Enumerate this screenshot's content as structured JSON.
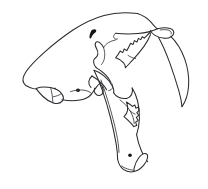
{
  "figure": {
    "style": "black ink line drawing, outline only, no shading",
    "background_color": "#ffffff",
    "line_color": "#2b2b2f",
    "mark_color": "#16161a",
    "width_px": 208,
    "height_px": 189,
    "caption": ""
  },
  "anatomy": {
    "parts": [
      {
        "id": "cranium",
        "label": "Cranium / braincase"
      },
      {
        "id": "frontal-foramen",
        "label": "Supraorbital marking"
      },
      {
        "id": "orbit",
        "label": "Orbit"
      },
      {
        "id": "zygomatic-arch",
        "label": "Zygomatic arch"
      },
      {
        "id": "nasal-snout",
        "label": "Nasal and snout"
      },
      {
        "id": "premaxilla-incisors",
        "label": "Premaxilla with incisors"
      },
      {
        "id": "infraorbital-dot",
        "label": "Infraorbital foramen"
      },
      {
        "id": "saber-canine",
        "label": "Upper saber canine"
      },
      {
        "id": "canine-root",
        "label": "Canine root and alveolus"
      },
      {
        "id": "upper-tooth-row",
        "label": "Upper premolars and carnassial"
      },
      {
        "id": "mandible",
        "label": "Mandible"
      },
      {
        "id": "coronoid-process",
        "label": "Coronoid process"
      },
      {
        "id": "lower-tooth-row",
        "label": "Lower premolars and molar"
      },
      {
        "id": "mandibular-flange",
        "label": "Mandibular chin flange"
      },
      {
        "id": "mental-foramen",
        "label": "Mental foramen"
      },
      {
        "id": "lower-canine",
        "label": "Lower canine region"
      }
    ]
  }
}
